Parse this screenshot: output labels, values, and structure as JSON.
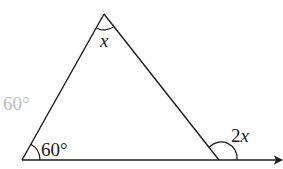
{
  "diagram": {
    "type": "triangle-exterior-angle",
    "colors": {
      "stroke": "#1a1a1a",
      "faded_label": "#bdbdbd",
      "background": "#ffffff"
    },
    "vertices": {
      "apex": {
        "x": 104,
        "y": 14
      },
      "bottom_left": {
        "x": 22,
        "y": 160
      },
      "bottom_right": {
        "x": 219,
        "y": 160
      }
    },
    "baseline_arrow_end": {
      "x": 283,
      "y": 160
    },
    "labels": {
      "apex_angle": "x",
      "left_angle": "60°",
      "exterior_angle": "2x",
      "faded_side_label": "60°"
    }
  }
}
